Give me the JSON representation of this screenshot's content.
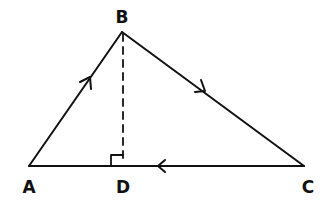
{
  "diagram": {
    "type": "triangle-with-altitude",
    "stroke_color": "#111111",
    "background": "#ffffff",
    "vertices": {
      "A": {
        "label": "A",
        "x": 29,
        "y": 166,
        "label_x": 29,
        "label_y": 193
      },
      "B": {
        "label": "B",
        "x": 122,
        "y": 32,
        "label_x": 122,
        "label_y": 23
      },
      "C": {
        "label": "C",
        "x": 304,
        "y": 166,
        "label_x": 308,
        "label_y": 193
      },
      "D": {
        "label": "D",
        "x": 123,
        "y": 166,
        "label_x": 123,
        "label_y": 193
      }
    },
    "segments": [
      {
        "name": "AB",
        "from": "A",
        "to": "B",
        "style": "solid",
        "arrow": "toward B"
      },
      {
        "name": "BC",
        "from": "B",
        "to": "C",
        "style": "solid",
        "arrow": "toward C"
      },
      {
        "name": "CA",
        "from": "C",
        "to": "A",
        "style": "solid",
        "arrow": "toward A"
      },
      {
        "name": "BD",
        "from": "B",
        "to": "D",
        "style": "dashed",
        "arrow": "none"
      }
    ],
    "right_angle_at": "D"
  }
}
